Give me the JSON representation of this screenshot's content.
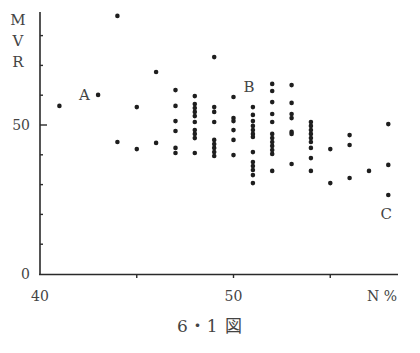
{
  "chart_data": {
    "type": "scatter",
    "title": "",
    "caption": "6・1 図",
    "xlabel": "N %",
    "ylabel": "MVR",
    "ylabel_letters": [
      "M",
      "V",
      "R"
    ],
    "xlim": [
      40,
      58.5
    ],
    "ylim": [
      0,
      87
    ],
    "x_ticks": [
      40,
      45,
      50,
      55
    ],
    "x_tick_labels": [
      {
        "value": 40,
        "label": "40"
      },
      {
        "value": 50,
        "label": "50"
      }
    ],
    "y_ticks": [
      10,
      20,
      30,
      40,
      50,
      60,
      70,
      80
    ],
    "y_tick_labels": [
      {
        "value": 0,
        "label": "0"
      },
      {
        "value": 50,
        "label": "50"
      }
    ],
    "grid": false,
    "annotations": [
      {
        "text": "A",
        "x": 42.3,
        "y": 60
      },
      {
        "text": "B",
        "x": 50.8,
        "y": 62.7
      },
      {
        "text": "C",
        "x": 57.9,
        "y": 20
      }
    ],
    "points": [
      {
        "x": 41,
        "y": 56.4
      },
      {
        "x": 43,
        "y": 60.1
      },
      {
        "x": 44,
        "y": 86.6
      },
      {
        "x": 44,
        "y": 44.3
      },
      {
        "x": 45,
        "y": 56.0
      },
      {
        "x": 45,
        "y": 41.9
      },
      {
        "x": 46,
        "y": 67.8
      },
      {
        "x": 46,
        "y": 44.0
      },
      {
        "x": 47,
        "y": 61.7
      },
      {
        "x": 47,
        "y": 56.4
      },
      {
        "x": 47,
        "y": 51.3
      },
      {
        "x": 47,
        "y": 48.0
      },
      {
        "x": 47,
        "y": 42.3
      },
      {
        "x": 47,
        "y": 40.6
      },
      {
        "x": 48,
        "y": 59.7
      },
      {
        "x": 48,
        "y": 57.0
      },
      {
        "x": 48,
        "y": 55.7
      },
      {
        "x": 48,
        "y": 54.4
      },
      {
        "x": 48,
        "y": 53.0
      },
      {
        "x": 48,
        "y": 51.0
      },
      {
        "x": 48,
        "y": 48.3
      },
      {
        "x": 48,
        "y": 47.0
      },
      {
        "x": 48,
        "y": 45.6
      },
      {
        "x": 48,
        "y": 40.6
      },
      {
        "x": 49,
        "y": 72.8
      },
      {
        "x": 49,
        "y": 56.0
      },
      {
        "x": 49,
        "y": 54.4
      },
      {
        "x": 49,
        "y": 51.0
      },
      {
        "x": 49,
        "y": 45.0
      },
      {
        "x": 49,
        "y": 43.6
      },
      {
        "x": 49,
        "y": 42.3
      },
      {
        "x": 49,
        "y": 40.9
      },
      {
        "x": 49,
        "y": 39.6
      },
      {
        "x": 50,
        "y": 59.4
      },
      {
        "x": 50,
        "y": 52.3
      },
      {
        "x": 50,
        "y": 51.3
      },
      {
        "x": 50,
        "y": 48.3
      },
      {
        "x": 50,
        "y": 45.0
      },
      {
        "x": 50,
        "y": 39.9
      },
      {
        "x": 51,
        "y": 56.0
      },
      {
        "x": 51,
        "y": 53.4
      },
      {
        "x": 51,
        "y": 51.3
      },
      {
        "x": 51,
        "y": 49.7
      },
      {
        "x": 51,
        "y": 48.3
      },
      {
        "x": 51,
        "y": 47.0
      },
      {
        "x": 51,
        "y": 46.0
      },
      {
        "x": 51,
        "y": 40.9
      },
      {
        "x": 51,
        "y": 37.6
      },
      {
        "x": 51,
        "y": 36.2
      },
      {
        "x": 51,
        "y": 34.9
      },
      {
        "x": 51,
        "y": 33.2
      },
      {
        "x": 51,
        "y": 30.5
      },
      {
        "x": 52,
        "y": 63.8
      },
      {
        "x": 52,
        "y": 61.4
      },
      {
        "x": 52,
        "y": 57.7
      },
      {
        "x": 52,
        "y": 53.7
      },
      {
        "x": 52,
        "y": 51.0
      },
      {
        "x": 52,
        "y": 47.0
      },
      {
        "x": 52,
        "y": 45.6
      },
      {
        "x": 52,
        "y": 44.3
      },
      {
        "x": 52,
        "y": 43.0
      },
      {
        "x": 52,
        "y": 41.6
      },
      {
        "x": 52,
        "y": 40.3
      },
      {
        "x": 52,
        "y": 34.6
      },
      {
        "x": 53,
        "y": 63.4
      },
      {
        "x": 53,
        "y": 57.4
      },
      {
        "x": 53,
        "y": 53.7
      },
      {
        "x": 53,
        "y": 52.3
      },
      {
        "x": 53,
        "y": 47.7
      },
      {
        "x": 53,
        "y": 47.0
      },
      {
        "x": 53,
        "y": 36.9
      },
      {
        "x": 54,
        "y": 51.0
      },
      {
        "x": 54,
        "y": 49.7
      },
      {
        "x": 54,
        "y": 48.3
      },
      {
        "x": 54,
        "y": 47.0
      },
      {
        "x": 54,
        "y": 45.6
      },
      {
        "x": 54,
        "y": 44.3
      },
      {
        "x": 54,
        "y": 42.3
      },
      {
        "x": 54,
        "y": 38.9
      },
      {
        "x": 54,
        "y": 34.6
      },
      {
        "x": 55,
        "y": 41.9
      },
      {
        "x": 55,
        "y": 30.5
      },
      {
        "x": 56,
        "y": 46.6
      },
      {
        "x": 56,
        "y": 43.3
      },
      {
        "x": 56,
        "y": 32.2
      },
      {
        "x": 57,
        "y": 34.6
      },
      {
        "x": 58,
        "y": 50.3
      },
      {
        "x": 58,
        "y": 36.6
      },
      {
        "x": 58,
        "y": 26.5
      }
    ]
  }
}
